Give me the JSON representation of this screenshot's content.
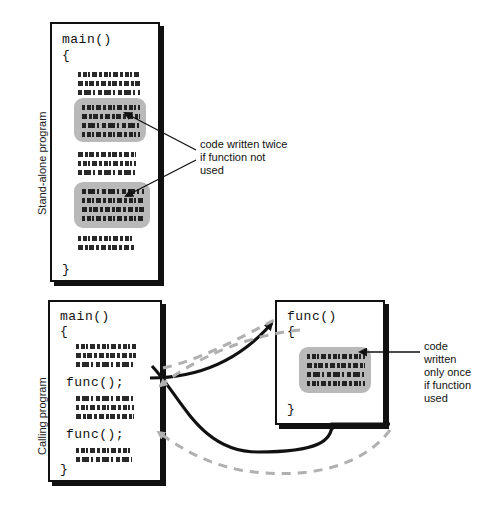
{
  "diagram": {
    "labels": {
      "standalone": "Stand-alone program",
      "calling": "Calling program"
    },
    "colors": {
      "ink": "#111111",
      "highlight": "#b9b9b9",
      "return_arrow": "#b0b0b0",
      "background": "#ffffff"
    },
    "top_panel": {
      "box_name": "standalone-program-box",
      "code": {
        "main_signature": "main()",
        "open_brace": "{",
        "close_brace": "}"
      },
      "annotation": "code written twice\nif function not\nused"
    },
    "bottom_panel": {
      "caller_box_name": "calling-program-box",
      "caller_code": {
        "main_signature": "main()",
        "open_brace": "{",
        "call_one": "func();",
        "call_two": "func();",
        "close_brace": "}"
      },
      "function_box_name": "function-definition-box",
      "function_code": {
        "func_signature": "func()",
        "open_brace": "{",
        "close_brace": "}"
      },
      "annotation": "code\nwritten\nonly once\nif function\nused"
    }
  }
}
